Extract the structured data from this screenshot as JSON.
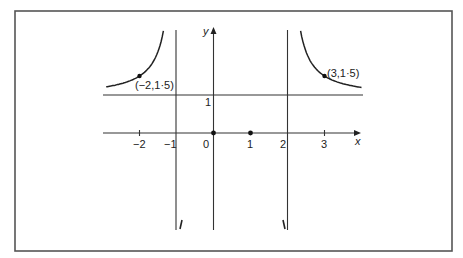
{
  "chart_data": {
    "type": "line",
    "title": "",
    "xlabel": "x",
    "ylabel": "y",
    "function": "y = x(x-1) / ((x+1)(x-2))",
    "grid": false,
    "xlim": [
      -2.9,
      4.0
    ],
    "ylim": [
      -2.6,
      2.7
    ],
    "x_ticks": [
      {
        "value": -2,
        "label": "−2"
      },
      {
        "value": -1,
        "label": "−1"
      },
      {
        "value": 0,
        "label": "0"
      },
      {
        "value": 1,
        "label": "1"
      },
      {
        "value": 2,
        "label": "2"
      },
      {
        "value": 3,
        "label": "3"
      }
    ],
    "y_ticks": [
      {
        "value": 1,
        "label": "1"
      }
    ],
    "asymptotes": {
      "vertical": [
        -1,
        2
      ],
      "horizontal": [
        1
      ]
    },
    "marked_points": [
      {
        "x": -2,
        "y": 1.5,
        "label": "(−2,1·5)"
      },
      {
        "x": 3,
        "y": 1.5,
        "label": "(3,1·5)"
      },
      {
        "x": 0,
        "y": 0,
        "label": ""
      },
      {
        "x": 1,
        "y": 0,
        "label": ""
      }
    ],
    "series": [
      {
        "name": "left branch",
        "x_range": [
          -2.9,
          -1.08
        ]
      },
      {
        "name": "right branch",
        "x_range": [
          2.1,
          4.0
        ]
      }
    ],
    "branch_marks": {
      "left": "/",
      "right": "\\"
    }
  }
}
